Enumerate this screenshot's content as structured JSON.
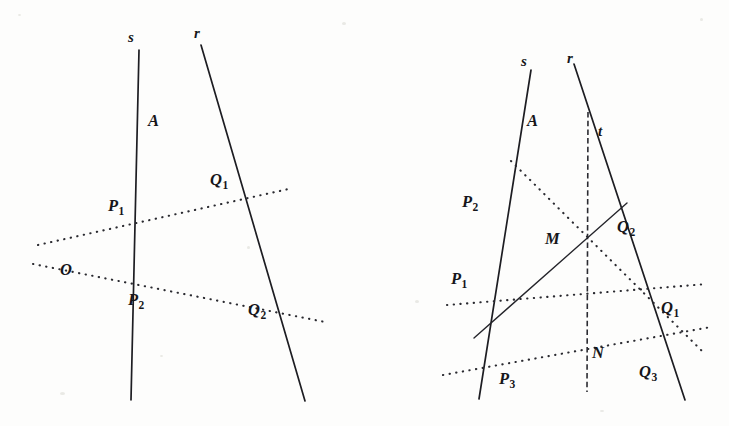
{
  "figure": {
    "background_color": "#fdfdfc",
    "ink_color": "#1d1d22",
    "panels": [
      {
        "id": "left-panel",
        "name": "left-construction",
        "line_labels": [
          {
            "id": "s",
            "text": "s",
            "x": 128,
            "y": 30
          },
          {
            "id": "r",
            "text": "r",
            "x": 194,
            "y": 26
          }
        ],
        "point_labels": [
          {
            "id": "A",
            "base": "A",
            "sub": "",
            "x": 148,
            "y": 113
          },
          {
            "id": "Q1",
            "base": "Q",
            "sub": "1",
            "x": 210,
            "y": 172
          },
          {
            "id": "P1",
            "base": "P",
            "sub": "1",
            "x": 108,
            "y": 198
          },
          {
            "id": "O",
            "base": "O",
            "sub": "",
            "x": 60,
            "y": 262
          },
          {
            "id": "P2",
            "base": "P",
            "sub": "2",
            "x": 128,
            "y": 292
          },
          {
            "id": "Q2",
            "base": "Q",
            "sub": "2",
            "x": 248,
            "y": 302
          }
        ],
        "solid_segments": [
          {
            "id": "line-s",
            "x1": 139,
            "y1": 50,
            "x2": 131,
            "y2": 400
          },
          {
            "id": "line-r",
            "x1": 201,
            "y1": 45,
            "x2": 305,
            "y2": 401
          }
        ],
        "dotted_segments": [
          {
            "id": "dotted-P1Q1",
            "x1": 38,
            "y1": 245,
            "x2": 293,
            "y2": 188
          },
          {
            "id": "dotted-P2Q2",
            "x1": 33,
            "y1": 264,
            "x2": 325,
            "y2": 322
          }
        ]
      },
      {
        "id": "right-panel",
        "name": "right-construction",
        "line_labels": [
          {
            "id": "s",
            "text": "s",
            "x": 521,
            "y": 54
          },
          {
            "id": "r",
            "text": "r",
            "x": 567,
            "y": 51
          },
          {
            "id": "t",
            "text": "t",
            "x": 598,
            "y": 124
          }
        ],
        "point_labels": [
          {
            "id": "A",
            "base": "A",
            "sub": "",
            "x": 527,
            "y": 113
          },
          {
            "id": "P2",
            "base": "P",
            "sub": "2",
            "x": 462,
            "y": 194
          },
          {
            "id": "Q2",
            "base": "Q",
            "sub": "2",
            "x": 617,
            "y": 219
          },
          {
            "id": "M",
            "base": "M",
            "sub": "",
            "x": 545,
            "y": 231
          },
          {
            "id": "P1",
            "base": "P",
            "sub": "1",
            "x": 451,
            "y": 271
          },
          {
            "id": "Q1",
            "base": "Q",
            "sub": "1",
            "x": 661,
            "y": 300
          },
          {
            "id": "N",
            "base": "N",
            "sub": "",
            "x": 592,
            "y": 345
          },
          {
            "id": "P3",
            "base": "P",
            "sub": "3",
            "x": 499,
            "y": 371
          },
          {
            "id": "Q3",
            "base": "Q",
            "sub": "3",
            "x": 639,
            "y": 364
          }
        ],
        "solid_segments": [
          {
            "id": "line-s",
            "x1": 531,
            "y1": 70,
            "x2": 479,
            "y2": 399
          },
          {
            "id": "line-r",
            "x1": 574,
            "y1": 64,
            "x2": 685,
            "y2": 400
          }
        ],
        "thin_solid_segments": [
          {
            "id": "line-P1-Q2",
            "x1": 474,
            "y1": 338,
            "x2": 627,
            "y2": 203
          }
        ],
        "dashed_segments": [
          {
            "id": "line-t",
            "x1": 588,
            "y1": 112,
            "x2": 587,
            "y2": 392
          }
        ],
        "dotted_segments": [
          {
            "id": "dotted-P2-Q1",
            "x1": 511,
            "y1": 161,
            "x2": 703,
            "y2": 352
          },
          {
            "id": "dotted-P1-Q1b",
            "x1": 447,
            "y1": 305,
            "x2": 707,
            "y2": 284
          },
          {
            "id": "dotted-P3-Q3",
            "x1": 443,
            "y1": 375,
            "x2": 711,
            "y2": 327
          }
        ]
      }
    ]
  }
}
